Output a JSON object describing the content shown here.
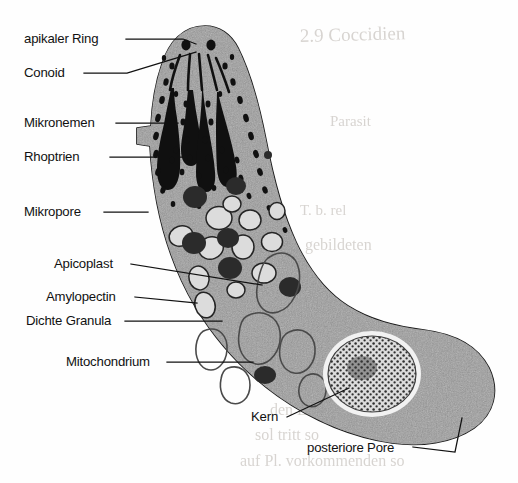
{
  "figure": {
    "organism_outline_name": "zoite-cell-outline",
    "colors": {
      "background": "#fefefe",
      "cytoplasm": "#a9a9a9",
      "outline": "#1a1a1a",
      "organelle_dark": "#101010",
      "dense_granule": "#2b2b2b",
      "amylopectin_fill": "#d8d8d8",
      "nucleus_stipple": "#3a3a3a",
      "nuclear_envelope": "#f2f2f2",
      "label_text": "#111111",
      "ghost_text": "#b9b3ad"
    }
  },
  "labels": [
    {
      "id": "apikaler-ring",
      "text": "apikaler Ring",
      "x": 24,
      "y": 43,
      "anchor": "start"
    },
    {
      "id": "conoid",
      "text": "Conoid",
      "x": 24,
      "y": 77,
      "anchor": "start"
    },
    {
      "id": "mikronemen",
      "text": "Mikronemen",
      "x": 24,
      "y": 127,
      "anchor": "start"
    },
    {
      "id": "rhoptrien",
      "text": "Rhoptrien",
      "x": 24,
      "y": 161,
      "anchor": "start"
    },
    {
      "id": "mikropore",
      "text": "Mikropore",
      "x": 24,
      "y": 216,
      "anchor": "start"
    },
    {
      "id": "apicoplast",
      "text": "Apicoplast",
      "x": 54,
      "y": 268,
      "anchor": "start"
    },
    {
      "id": "amylopectin",
      "text": "Amylopectin",
      "x": 46,
      "y": 301,
      "anchor": "start"
    },
    {
      "id": "dichte-granula",
      "text": "Dichte Granula",
      "x": 26,
      "y": 325,
      "anchor": "start"
    },
    {
      "id": "mitochondrium",
      "text": "Mitochondrium",
      "x": 66,
      "y": 366,
      "anchor": "start"
    },
    {
      "id": "kern",
      "text": "Kern",
      "x": 251,
      "y": 421,
      "anchor": "start"
    },
    {
      "id": "posteriore-pore",
      "text": "posteriore Pore",
      "x": 307,
      "y": 452,
      "anchor": "start"
    }
  ],
  "ghost_text": [
    {
      "id": "ghost-1",
      "text": "2.9  Coccidien",
      "x": 300,
      "y": 42,
      "size": 19
    },
    {
      "id": "ghost-2",
      "text": "Parasit",
      "x": 330,
      "y": 126,
      "size": 15
    },
    {
      "id": "ghost-3",
      "text": "T. b.  rel",
      "x": 300,
      "y": 215,
      "size": 15
    },
    {
      "id": "ghost-4",
      "text": "gebildeten",
      "x": 305,
      "y": 250,
      "size": 16
    },
    {
      "id": "ghost-5",
      "text": "ogen",
      "x": 290,
      "y": 390,
      "size": 16
    },
    {
      "id": "ghost-6",
      "text": "den Lebe",
      "x": 270,
      "y": 415,
      "size": 16
    },
    {
      "id": "ghost-7",
      "text": "sol tritt so",
      "x": 255,
      "y": 440,
      "size": 16
    },
    {
      "id": "ghost-8",
      "text": "auf Pl. vorkommenden so",
      "x": 240,
      "y": 466,
      "size": 16
    }
  ],
  "structures": {
    "apical_rings": 2,
    "conoid_fibers": 5,
    "rhoptries": 4,
    "micronemes_count": 46,
    "dense_granules_count": 8,
    "amylopectin_count": 12,
    "mitochondrion_profiles": 6,
    "nucleus": {
      "cx": 372,
      "cy": 374,
      "rx": 44,
      "ry": 38
    },
    "posterior_pore": {
      "x": 455,
      "y": 418
    }
  }
}
